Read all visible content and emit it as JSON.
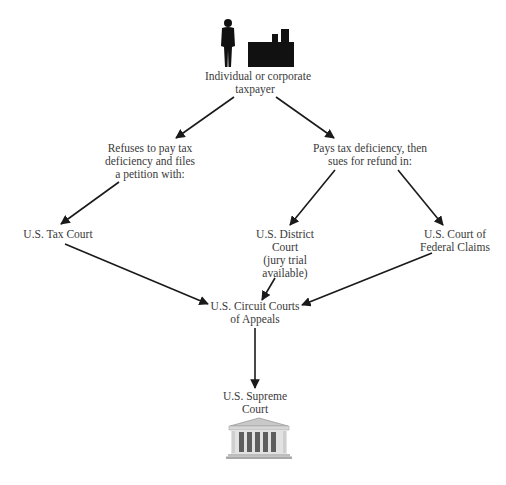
{
  "diagram": {
    "type": "flowchart",
    "nodes": {
      "taxpayer": {
        "lines": [
          "Individual or corporate",
          "taxpayer"
        ],
        "icons": [
          "person-icon",
          "factory-icon"
        ]
      },
      "refuses": {
        "lines": [
          "Refuses to pay tax",
          "deficiency and files",
          "a petition with:"
        ]
      },
      "pays": {
        "lines": [
          "Pays tax deficiency, then",
          "sues for refund in:"
        ]
      },
      "tax_court": {
        "lines": [
          "U.S. Tax Court"
        ]
      },
      "district_court": {
        "lines": [
          "U.S. District",
          "Court",
          "(jury trial",
          "available)"
        ]
      },
      "federal_claims": {
        "lines": [
          "U.S. Court of",
          "Federal Claims"
        ]
      },
      "circuit_courts": {
        "lines": [
          "U.S. Circuit Courts",
          "of Appeals"
        ]
      },
      "supreme_court": {
        "lines": [
          "U.S. Supreme",
          "Court"
        ],
        "icons": [
          "courthouse-icon"
        ]
      }
    },
    "edges": [
      {
        "from": "taxpayer",
        "to": "refuses"
      },
      {
        "from": "taxpayer",
        "to": "pays"
      },
      {
        "from": "refuses",
        "to": "tax_court"
      },
      {
        "from": "pays",
        "to": "district_court"
      },
      {
        "from": "pays",
        "to": "federal_claims"
      },
      {
        "from": "tax_court",
        "to": "circuit_courts"
      },
      {
        "from": "district_court",
        "to": "circuit_courts"
      },
      {
        "from": "federal_claims",
        "to": "circuit_courts"
      },
      {
        "from": "circuit_courts",
        "to": "supreme_court"
      }
    ],
    "colors": {
      "arrow": "#1a1a1a",
      "text": "#3a3a3a",
      "icon": "#111111",
      "building": "#9a9a9a"
    }
  }
}
